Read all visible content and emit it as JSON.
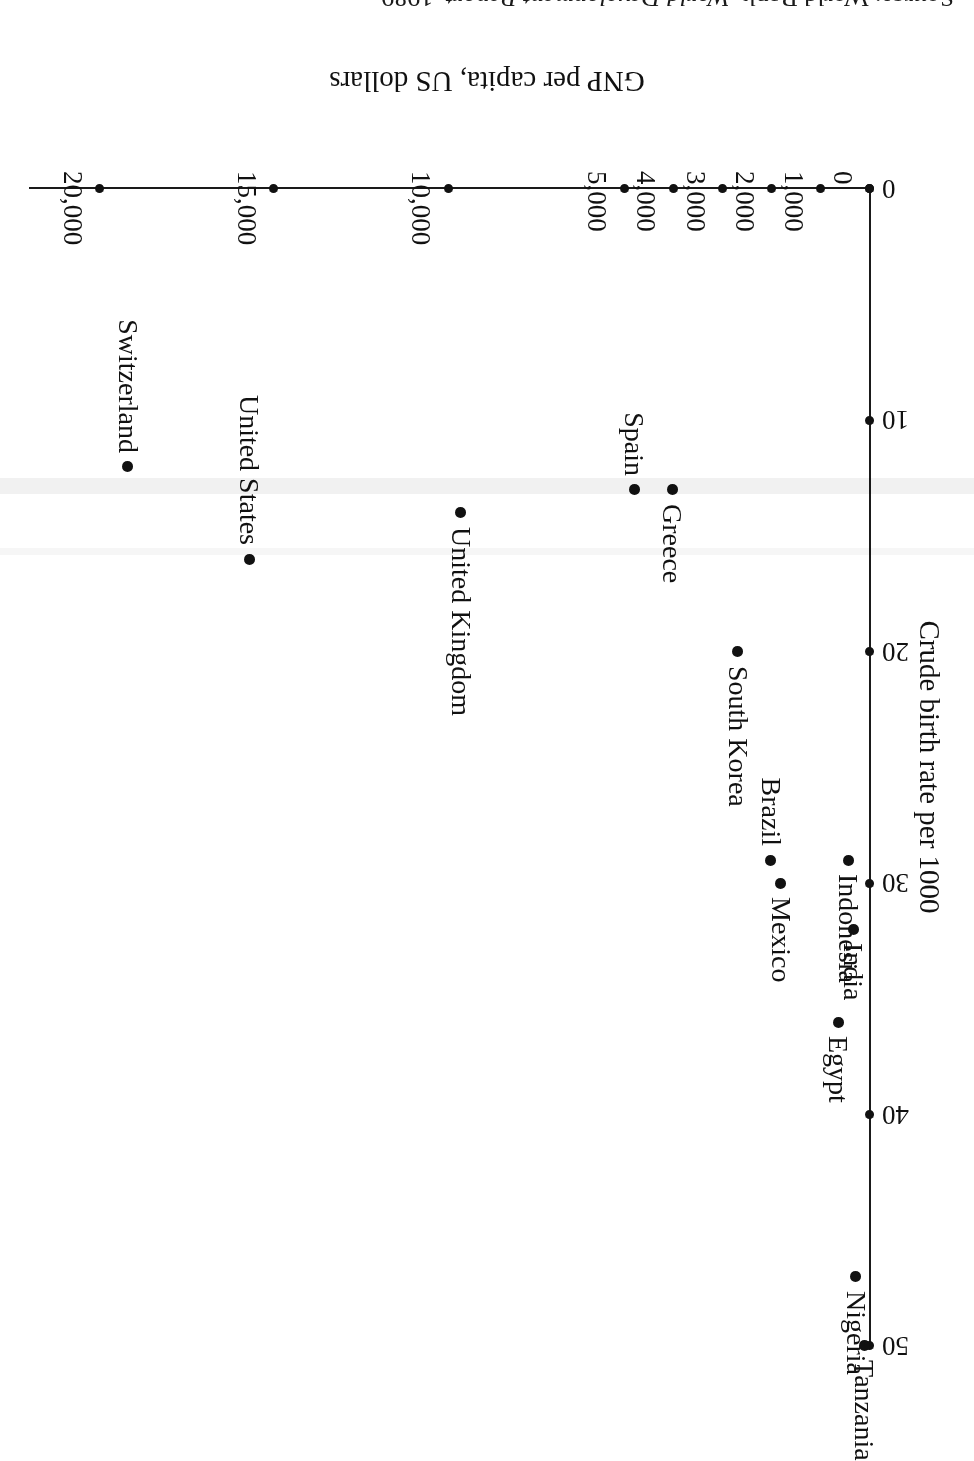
{
  "chart_data": {
    "type": "scatter",
    "title": "",
    "xlabel": "GNP per capita, US dollars",
    "ylabel": "Crude birth rate per 1000",
    "grid": false,
    "legend": "none",
    "orientation_note": "page scanned upside down; entire figure appears rotated 180 degrees",
    "x_ticks": [
      "0",
      "1,000",
      "2,000",
      "3,000",
      "4,000",
      "5,000",
      "10,000",
      "15,000",
      "20,000"
    ],
    "x_tick_values": [
      0,
      1000,
      2000,
      3000,
      4000,
      5000,
      10000,
      15000,
      20000
    ],
    "y_ticks": [
      "0",
      "10",
      "20",
      "30",
      "40",
      "50"
    ],
    "y_tick_values": [
      0,
      10,
      20,
      30,
      40,
      50
    ],
    "xlim": [
      0,
      20000
    ],
    "ylim": [
      0,
      50
    ],
    "points": [
      {
        "label": "Tanzania",
        "x": 120,
        "y": 50
      },
      {
        "label": "Nigeria",
        "x": 290,
        "y": 47
      },
      {
        "label": "Egypt",
        "x": 650,
        "y": 36
      },
      {
        "label": "India",
        "x": 340,
        "y": 32
      },
      {
        "label": "Indonesia",
        "x": 440,
        "y": 29
      },
      {
        "label": "Mexico",
        "x": 1820,
        "y": 30
      },
      {
        "label": "Brazil",
        "x": 2020,
        "y": 29
      },
      {
        "label": "South Korea",
        "x": 2690,
        "y": 20
      },
      {
        "label": "Greece",
        "x": 4020,
        "y": 13
      },
      {
        "label": "Spain",
        "x": 4800,
        "y": 13
      },
      {
        "label": "United Kingdom",
        "x": 9650,
        "y": 14
      },
      {
        "label": "United States",
        "x": 15700,
        "y": 16
      },
      {
        "label": "Switzerland",
        "x": 19200,
        "y": 12
      }
    ]
  },
  "axes": {
    "x_title": "GNP per capita, US dollars",
    "y_title": "Crude birth rate per 1000"
  },
  "source": {
    "prefix": "Source: World Bank,",
    "title": "World Development Report",
    "year": ", 1989"
  }
}
